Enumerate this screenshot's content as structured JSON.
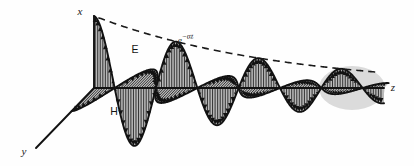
{
  "figure": {
    "axes": [
      {
        "id": "x",
        "label": "x",
        "direction": "vertical-up"
      },
      {
        "id": "y",
        "label": "y",
        "direction": "diagonal-down-left"
      },
      {
        "id": "z",
        "label": "z",
        "direction": "horizontal-right"
      }
    ],
    "field_labels": [
      {
        "id": "E",
        "label": "E",
        "description": "electric field, polarized along x"
      },
      {
        "id": "H",
        "label": "H",
        "description": "magnetic field, polarized along y"
      }
    ],
    "envelope": {
      "base": "e",
      "exponent_minus": "−",
      "exponent_alpha": "α",
      "exponent_var": "z",
      "label": "e−αz",
      "style": "dashed",
      "description": "exponential decay envelope of the wave amplitude"
    },
    "colors": {
      "stroke": "#121212",
      "fill_gray": "#b9b9b9",
      "fill_gray_light": "#cccccc",
      "background": "#fefefe",
      "dashed": "#1a1a1a"
    }
  },
  "chart_data": {
    "type": "line",
    "xlabel": "z",
    "ylabel": "x",
    "zlabel": "y",
    "grid": false,
    "legend": [
      "E",
      "H"
    ],
    "legend_position": "inline-annotation",
    "xlim": [
      0,
      1
    ],
    "ylim": [
      -1,
      1
    ],
    "annotations": [
      "e−αz",
      "E",
      "H",
      "x",
      "y",
      "z"
    ],
    "attenuation_alpha": 1.55,
    "wavelength_fraction": 0.285,
    "series": [
      {
        "name": "E",
        "orientation": "x-direction (vertical)",
        "description": "E = E0 e^(-alpha z) cos(beta z), arrows vertical along x",
        "arrow_count": 44
      },
      {
        "name": "H",
        "orientation": "y-direction (into-page diagonal)",
        "description": "H = H0 e^(-alpha z) cos(beta z), arrows along y, in phase with E",
        "arrow_count": 44
      },
      {
        "name": "envelope",
        "orientation": "x-direction (vertical)",
        "description": "dashed curve e^(-alpha z) bounding the E wave peaks",
        "arrow_count": 0
      }
    ]
  }
}
